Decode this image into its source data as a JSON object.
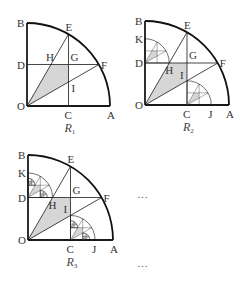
{
  "figures": [
    {
      "id": "R1",
      "caption_letter": "R",
      "caption_sub": "1",
      "depth": 0,
      "labels": {
        "O": "O",
        "A": "A",
        "B": "B",
        "C": "C",
        "D": "D",
        "E": "E",
        "F": "F",
        "G": "G",
        "H": "H",
        "I": "I"
      }
    },
    {
      "id": "R2",
      "caption_letter": "R",
      "caption_sub": "2",
      "depth": 1,
      "labels": {
        "O": "O",
        "A": "A",
        "B": "B",
        "C": "C",
        "D": "D",
        "E": "E",
        "F": "F",
        "G": "G",
        "H": "H",
        "I": "I",
        "J": "J",
        "K": "K"
      }
    },
    {
      "id": "R3",
      "caption_letter": "R",
      "caption_sub": "3",
      "depth": 2,
      "labels": {
        "O": "O",
        "A": "A",
        "B": "B",
        "C": "C",
        "D": "D",
        "E": "E",
        "F": "F",
        "G": "G",
        "H": "H",
        "I": "I",
        "J": "J",
        "K": "K"
      }
    }
  ],
  "ellipsis": [
    "…",
    "…"
  ],
  "colors": {
    "line": "#1a1a1a",
    "arc": "#111111",
    "shade": "#d6d6d6"
  }
}
